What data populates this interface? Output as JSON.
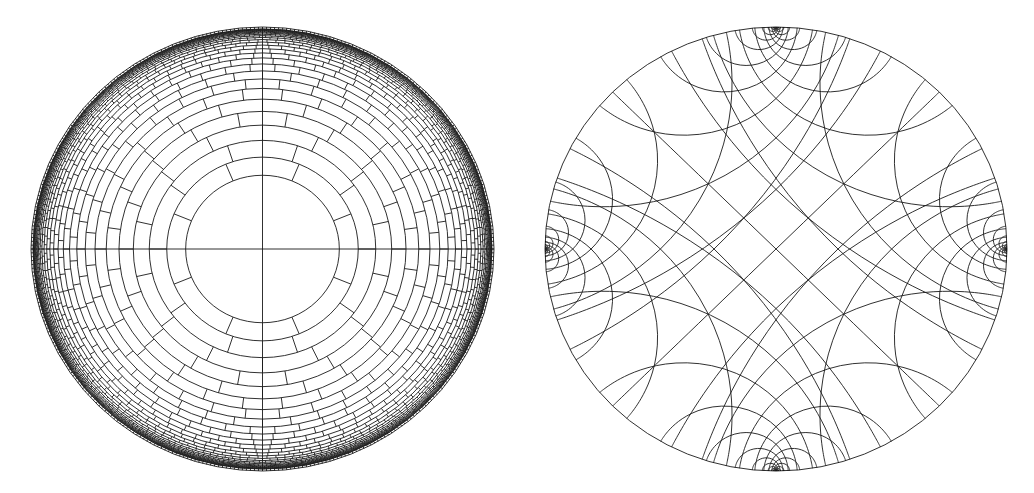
{
  "canvas": {
    "width": 1034,
    "height": 493,
    "background": "#ffffff",
    "stroke": "#1a1a1a"
  },
  "figures": [
    {
      "id": "left",
      "kind": "hyperbolic-brick-tiling",
      "description": "Poincare disk with concentric rings at equal hyperbolic spacing and brick-like staggered radial segments",
      "center": [
        262.5,
        249
      ],
      "rx": 231.5,
      "ry": 222,
      "first_ring_distance": 0.69,
      "ring_step": 0.19,
      "ring_count": 26,
      "base_segments": 8,
      "inner_cross": true,
      "stroke_width": 0.9
    },
    {
      "id": "right",
      "kind": "hyperbolic-geodesic-lattice",
      "description": "Poincare disk with two families of geodesics (diagonal diameters translated along horizontal and vertical axes)",
      "center": [
        776,
        249
      ],
      "rx": 231,
      "ry": 222,
      "translation_step": 0.55,
      "translation_count": 11,
      "stroke_width": 0.9
    }
  ]
}
